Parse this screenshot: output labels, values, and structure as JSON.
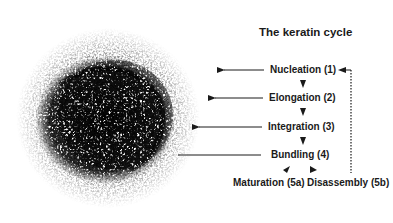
{
  "diagram": {
    "title": "The keratin cycle",
    "steps": [
      {
        "label": "Nucleation (1)",
        "step": "1"
      },
      {
        "label": "Elongation (2)",
        "step": "2"
      },
      {
        "label": "Integration (3)",
        "step": "3"
      },
      {
        "label": "Bundling (4)",
        "step": "4"
      }
    ],
    "branches": [
      {
        "label": "Maturation (5a)",
        "step": "5a"
      },
      {
        "label": "Disassembly (5b)",
        "step": "5b"
      }
    ],
    "image": {
      "description": "micrograph of keratin filament network in a cell",
      "color": "#111111"
    },
    "colors": {
      "text": "#1a1a1a",
      "arrow": "#1a1a1a",
      "background": "#ffffff"
    }
  }
}
